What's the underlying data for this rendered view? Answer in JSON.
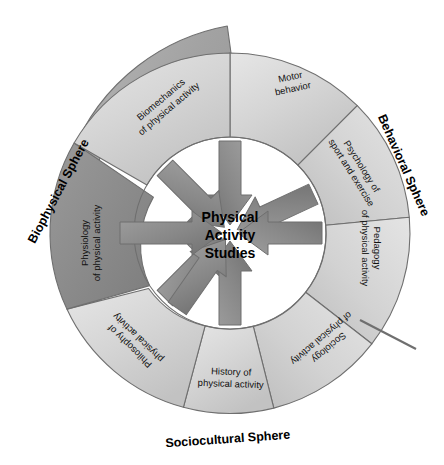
{
  "diagram": {
    "title": "Physical Activity Studies",
    "center": {
      "line1": "Physical",
      "line2": "Activity",
      "line3": "Studies"
    },
    "spheres": [
      {
        "name": "biophysical",
        "label": "Biophysical Sphere"
      },
      {
        "name": "behavioral",
        "label": "Behavioral Sphere"
      },
      {
        "name": "sociocultural",
        "label": "Sociocultural Sphere"
      }
    ],
    "segments": [
      {
        "name": "motor-behavior",
        "line1": "Motor",
        "line2": "behavior",
        "sphere": "behavioral"
      },
      {
        "name": "psychology",
        "line1": "Psychology of",
        "line2": "sport and exercise",
        "sphere": "behavioral"
      },
      {
        "name": "pedagogy",
        "line1": "Pedagogy",
        "line2": "of physical activity",
        "sphere": "behavioral"
      },
      {
        "name": "sociology",
        "line1": "Sociology",
        "line2": "of physical activity",
        "sphere": "sociocultural"
      },
      {
        "name": "history",
        "line1": "History of",
        "line2": "physical activity",
        "sphere": "sociocultural"
      },
      {
        "name": "philosophy",
        "line1": "Philosophy of",
        "line2": "physical activity",
        "sphere": "sociocultural"
      },
      {
        "name": "physiology",
        "line1": "Physiology",
        "line2": "of physical activity",
        "sphere": "biophysical"
      },
      {
        "name": "biomechanics",
        "line1": "Biomechanics",
        "line2": "of physical activity",
        "sphere": "biophysical"
      }
    ],
    "colors": {
      "ring_light": "#d9d9d9",
      "ring_dark": "#8d8d8d",
      "outer_band": "#a8a8a8",
      "arrow": "#7d7d7d",
      "stroke": "#6f6f6f",
      "text": "#111111"
    }
  }
}
